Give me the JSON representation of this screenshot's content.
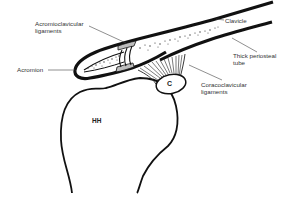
{
  "diagram": {
    "labels": {
      "acromioclavicular_line1": "Acromioclavicular",
      "acromioclavicular_line2": "ligaments",
      "acromion": "Acromion",
      "clavicle": "Clavicle",
      "periosteal_line1": "Thick periosteal",
      "periosteal_line2": "tube",
      "coracoclavicular_line1": "Coracoclavicular",
      "coracoclavicular_line2": "ligaments",
      "coracoid": "C",
      "humeral_head": "HH"
    },
    "colors": {
      "stroke": "#111111",
      "leader": "#444444",
      "ligament_fill": "#bdbdbd",
      "background": "#ffffff"
    }
  }
}
